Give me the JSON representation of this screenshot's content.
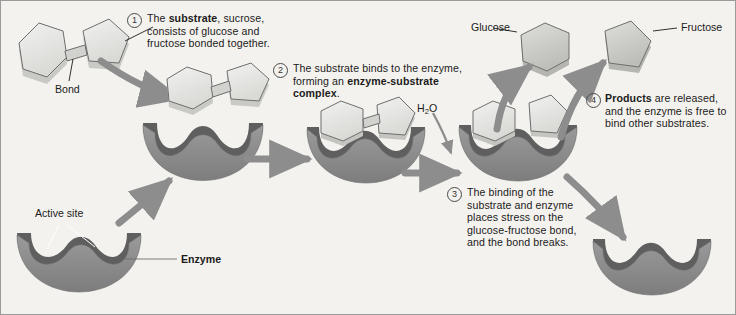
{
  "figure": {
    "background_color": "#f4f2ee",
    "enzyme_color": "#8a8a8a",
    "enzyme_shadow_color": "#5f5f5f",
    "substrate_color": "#e8e8e6",
    "arrow_color": "#8d8d8d"
  },
  "steps": [
    {
      "number": "1",
      "marker": "①",
      "text_parts": [
        {
          "text": "The ",
          "bold": false
        },
        {
          "text": "substrate",
          "bold": true
        },
        {
          "text": ", sucrose, consists of glucose and fructose bonded together.",
          "bold": false
        }
      ],
      "plain": "The substrate, sucrose, consists of glucose and fructose bonded together."
    },
    {
      "number": "2",
      "marker": "②",
      "text_parts": [
        {
          "text": "The substrate binds to the enzyme, forming an ",
          "bold": false
        },
        {
          "text": "enzyme-substrate complex",
          "bold": true
        },
        {
          "text": ".",
          "bold": false
        }
      ],
      "plain": "The substrate binds to the enzyme, forming an enzyme-substrate complex."
    },
    {
      "number": "3",
      "marker": "③",
      "text_parts": [
        {
          "text": "The binding of the substrate and enzyme places stress on the glucose-fructose bond, and the bond breaks.",
          "bold": false
        }
      ],
      "plain": "The binding of the substrate and enzyme places stress on the glucose-fructose bond, and the bond breaks."
    },
    {
      "number": "4",
      "marker": "④",
      "text_parts": [
        {
          "text": "Products",
          "bold": true
        },
        {
          "text": " are released, and the enzyme is free to bind other substrates.",
          "bold": false
        }
      ],
      "plain": "Products are released, and the enzyme is free to bind other substrates."
    }
  ],
  "labels": {
    "bond": "Bond",
    "active_site": "Active site",
    "enzyme": "Enzyme",
    "glucose": "Glucose",
    "fructose": "Fructose",
    "water_main": "H",
    "water_sub": "2",
    "water_tail": "O"
  }
}
